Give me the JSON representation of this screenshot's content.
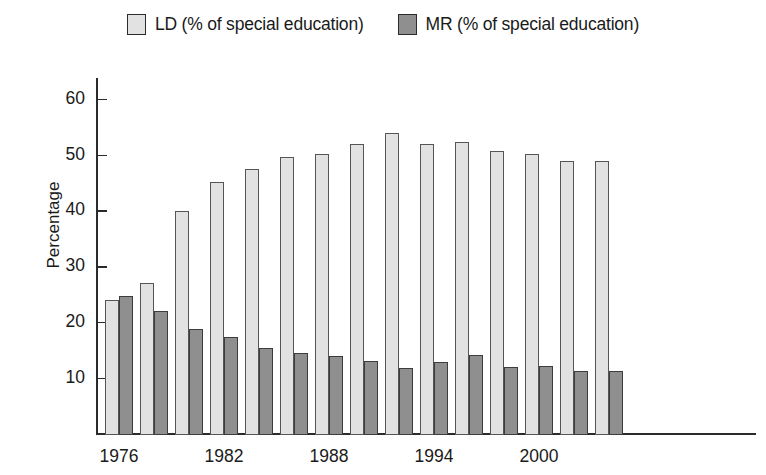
{
  "legend": {
    "position": "top-center",
    "entries": [
      {
        "key": "LD",
        "label": "LD (% of special education)",
        "color": "#e2e2e2",
        "swatch_name": "ld-swatch"
      },
      {
        "key": "MR",
        "label": "MR (% of special education)",
        "color": "#8f8f8f",
        "swatch_name": "mr-swatch"
      }
    ]
  },
  "axes": {
    "ylabel": "Percentage",
    "xlabel": "",
    "yticks": [
      10,
      20,
      30,
      40,
      50,
      60
    ],
    "ytick_labels": [
      "10",
      "20",
      "30",
      "40",
      "50",
      "60"
    ],
    "xtick_labels": [
      "1976",
      "1982",
      "1988",
      "1994",
      "2000"
    ],
    "ylim": [
      0,
      64
    ],
    "grid": false
  },
  "chart_data": {
    "type": "bar",
    "title": "",
    "subtitle": "",
    "xlabel": "",
    "ylabel": "Percentage",
    "ylim": [
      0,
      64
    ],
    "yticks": [
      10,
      20,
      30,
      40,
      50,
      60
    ],
    "grid": false,
    "legend_position": "top-center",
    "categories": [
      "1976",
      "1978",
      "1980",
      "1982",
      "1984",
      "1986",
      "1988",
      "1990",
      "1992",
      "1994",
      "1996",
      "1998",
      "2000",
      "2002",
      "2004"
    ],
    "xtick_labels_shown": [
      "1976",
      "1982",
      "1988",
      "1994",
      "2000"
    ],
    "series": [
      {
        "name": "LD (% of special education)",
        "color": "#e2e2e2",
        "values": [
          24.2,
          27.2,
          40.2,
          45.4,
          47.7,
          49.8,
          50.4,
          52.2,
          54.1,
          52.2,
          52.5,
          51.0,
          50.4,
          49.2,
          49.2
        ]
      },
      {
        "name": "MR (% of special education)",
        "color": "#8f8f8f",
        "values": [
          25.0,
          22.3,
          19.0,
          17.6,
          15.6,
          14.7,
          14.1,
          13.2,
          12.1,
          13.1,
          14.4,
          12.2,
          12.4,
          11.4,
          11.4
        ]
      }
    ]
  }
}
